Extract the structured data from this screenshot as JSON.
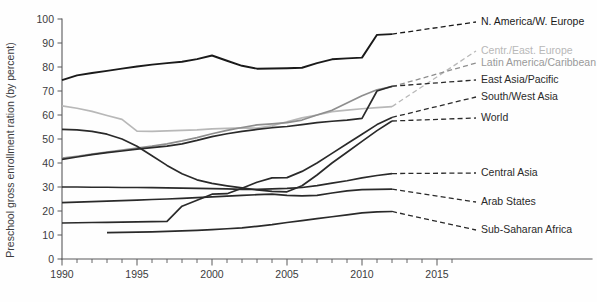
{
  "chart_data": {
    "type": "line",
    "title": "",
    "xlabel": "",
    "ylabel": "Preschool gross enrollment ration (by percent)",
    "xlim": [
      1990,
      2015
    ],
    "ylim": [
      0,
      100
    ],
    "yticks": [
      0,
      10,
      20,
      30,
      40,
      50,
      60,
      70,
      80,
      90,
      100
    ],
    "xticks": [
      1990,
      1995,
      2000,
      2005,
      2010,
      2015
    ],
    "x_minor_tick_step": 1,
    "grid": false,
    "legend_position": "right",
    "series": [
      {
        "name": "N. America/W. Europe",
        "color": "#1a1a1a",
        "width": 1.9,
        "x": [
          1990,
          1991,
          1992,
          1993,
          1994,
          1995,
          1996,
          1997,
          1998,
          1999,
          2000,
          2001,
          2002,
          2003,
          2004,
          2005,
          2006,
          2007,
          2008,
          2009,
          2010,
          2011,
          2012
        ],
        "values": [
          74.5,
          76.5,
          77.5,
          78.4,
          79.3,
          80.2,
          81.0,
          81.6,
          82.2,
          83.3,
          84.8,
          82.6,
          80.5,
          79.3,
          79.4,
          79.5,
          79.7,
          81.6,
          83.2,
          83.6,
          83.9,
          93.4,
          93.7
        ],
        "label_y": 22
      },
      {
        "name": "Centr./East. Europe",
        "color": "#b8b8b8",
        "width": 1.7,
        "x": [
          1990,
          1991,
          1992,
          1993,
          1994,
          1995,
          1996,
          1997,
          1998,
          1999,
          2000,
          2001,
          2002,
          2003,
          2004,
          2005,
          2006,
          2007,
          2008,
          2009,
          2010,
          2011,
          2012
        ],
        "values": [
          63.8,
          62.8,
          61.5,
          59.8,
          58.2,
          53.3,
          53.2,
          53.4,
          53.6,
          53.8,
          54.2,
          54.4,
          54.6,
          54.5,
          55.5,
          57.2,
          58.8,
          60.0,
          61.4,
          62.0,
          62.6,
          63.1,
          63.5
        ],
        "label_y": 51
      },
      {
        "name": "Latin America/Caribbean",
        "color": "#8e8e8e",
        "width": 1.7,
        "x": [
          1990,
          1991,
          1992,
          1993,
          1994,
          1995,
          1996,
          1997,
          1998,
          1999,
          2000,
          2001,
          2002,
          2003,
          2004,
          2005,
          2006,
          2007,
          2008,
          2009,
          2010,
          2011,
          2012
        ],
        "values": [
          42.0,
          42.8,
          43.7,
          44.5,
          45.4,
          46.2,
          47.0,
          48.0,
          49.2,
          50.6,
          52.2,
          53.6,
          54.8,
          55.9,
          56.3,
          56.8,
          57.9,
          60.0,
          62.0,
          65.0,
          68.0,
          70.5,
          71.8
        ],
        "label_y": 63
      },
      {
        "name": "East Asia/Pacific",
        "color": "#2a2a2a",
        "width": 1.7,
        "x": [
          1990,
          1991,
          1992,
          1993,
          1994,
          1995,
          1996,
          1997,
          1998,
          1999,
          2000,
          2001,
          2002,
          2003,
          2004,
          2005,
          2006,
          2007,
          2008,
          2009,
          2010,
          2011,
          2012
        ],
        "values": [
          41.5,
          42.5,
          43.5,
          44.3,
          45.0,
          45.8,
          46.4,
          47.0,
          48.0,
          49.4,
          51.0,
          52.2,
          53.2,
          54.0,
          54.7,
          55.2,
          56.0,
          56.8,
          57.4,
          57.9,
          58.6,
          70.0,
          72.0
        ],
        "label_y": 80
      },
      {
        "name": "South/West Asia",
        "color": "#2a2a2a",
        "width": 1.7,
        "x": [
          1990,
          1991,
          1992,
          1993,
          1994,
          1995,
          1996,
          1997,
          1998,
          1999,
          2000,
          2001,
          2002,
          2003,
          2004,
          2005,
          2006,
          2007,
          2008,
          2009,
          2010,
          2011,
          2012
        ],
        "values": [
          15.0,
          15.1,
          15.2,
          15.3,
          15.4,
          15.5,
          15.6,
          15.7,
          22.0,
          24.5,
          27.0,
          27.2,
          29.5,
          32.0,
          33.8,
          33.9,
          36.5,
          40.0,
          44.0,
          48.0,
          52.0,
          56.0,
          59.0
        ],
        "label_y": 97
      },
      {
        "name": "World",
        "color": "#2a2a2a",
        "width": 1.7,
        "x": [
          1990,
          1991,
          1992,
          1993,
          1994,
          1995,
          1996,
          1997,
          1998,
          1999,
          2000,
          2001,
          2002,
          2003,
          2004,
          2005,
          2006,
          2007,
          2008,
          2009,
          2010,
          2011,
          2012
        ],
        "values": [
          54.0,
          53.8,
          53.2,
          52.0,
          50.0,
          47.0,
          43.0,
          39.0,
          35.5,
          33.0,
          31.5,
          30.5,
          29.6,
          28.8,
          28.2,
          28.0,
          30.5,
          35.0,
          40.0,
          44.5,
          49.0,
          53.5,
          57.5
        ],
        "label_y": 118
      },
      {
        "name": "Central Asia",
        "color": "#2a2a2a",
        "width": 1.7,
        "x": [
          1990,
          1991,
          1992,
          1993,
          1994,
          1995,
          1996,
          1997,
          1998,
          1999,
          2000,
          2001,
          2002,
          2003,
          2004,
          2005,
          2006,
          2007,
          2008,
          2009,
          2010,
          2011,
          2012
        ],
        "values": [
          30.0,
          30.0,
          29.9,
          29.9,
          29.8,
          29.8,
          29.7,
          29.6,
          29.5,
          29.4,
          29.3,
          29.2,
          29.0,
          29.0,
          29.2,
          29.4,
          29.8,
          30.6,
          31.6,
          32.6,
          33.8,
          34.8,
          35.6
        ],
        "label_y": 173
      },
      {
        "name": "Arab States",
        "color": "#2a2a2a",
        "width": 1.7,
        "x": [
          1990,
          1991,
          1992,
          1993,
          1994,
          1995,
          1996,
          1997,
          1998,
          1999,
          2000,
          2001,
          2002,
          2003,
          2004,
          2005,
          2006,
          2007,
          2008,
          2009,
          2010,
          2011,
          2012
        ],
        "values": [
          23.5,
          23.7,
          23.9,
          24.1,
          24.3,
          24.5,
          24.8,
          25.0,
          25.3,
          25.6,
          25.9,
          26.2,
          26.5,
          26.8,
          27.0,
          26.5,
          26.3,
          26.5,
          27.5,
          28.4,
          28.9,
          29.0,
          29.1
        ],
        "label_y": 202
      },
      {
        "name": "Sub-Saharan Africa",
        "color": "#2a2a2a",
        "width": 1.7,
        "x": [
          1993,
          1994,
          1995,
          1996,
          1997,
          1998,
          1999,
          2000,
          2001,
          2002,
          2003,
          2004,
          2005,
          2006,
          2007,
          2008,
          2009,
          2010,
          2011,
          2012
        ],
        "values": [
          11.0,
          11.1,
          11.2,
          11.3,
          11.5,
          11.7,
          11.9,
          12.2,
          12.6,
          13.0,
          13.6,
          14.3,
          15.2,
          16.0,
          16.8,
          17.6,
          18.4,
          19.2,
          19.6,
          19.8
        ],
        "label_y": 230
      }
    ]
  },
  "legend": {
    "items": [
      {
        "label": "N. America/W. Europe",
        "color": "#1a1a1a"
      },
      {
        "label": "Centr./East. Europe",
        "color": "#b8b8b8"
      },
      {
        "label": "Latin America/Caribbean",
        "color": "#9a9a9a"
      },
      {
        "label": "East Asia/Pacific",
        "color": "#2a2a2a"
      },
      {
        "label": "South/West Asia",
        "color": "#2a2a2a"
      },
      {
        "label": "World",
        "color": "#2a2a2a"
      },
      {
        "label": "Central Asia",
        "color": "#2a2a2a"
      },
      {
        "label": "Arab States",
        "color": "#2a2a2a"
      },
      {
        "label": "Sub-Saharan Africa",
        "color": "#2a2a2a"
      }
    ]
  }
}
